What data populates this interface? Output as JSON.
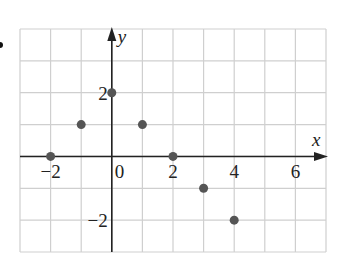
{
  "chart_data": {
    "type": "scatter",
    "title": "",
    "xlabel": "x",
    "ylabel": "y",
    "xlim": [
      -3,
      7
    ],
    "ylim": [
      -3,
      4
    ],
    "grid": true,
    "x_ticks": [
      {
        "value": -2,
        "label": "−2"
      },
      {
        "value": 0,
        "label": "0"
      },
      {
        "value": 2,
        "label": "2"
      },
      {
        "value": 4,
        "label": "4"
      },
      {
        "value": 6,
        "label": "6"
      }
    ],
    "y_ticks": [
      {
        "value": 2,
        "label": "2"
      },
      {
        "value": -2,
        "label": "−2"
      }
    ],
    "points": [
      {
        "x": -2,
        "y": 0
      },
      {
        "x": -1,
        "y": 1
      },
      {
        "x": 0,
        "y": 2
      },
      {
        "x": 1,
        "y": 1
      },
      {
        "x": 2,
        "y": 0
      },
      {
        "x": 3,
        "y": -1
      },
      {
        "x": 4,
        "y": -2
      }
    ],
    "colors": {
      "grid": "#cfcfcf",
      "axis": "#222222",
      "point": "#555555"
    }
  }
}
